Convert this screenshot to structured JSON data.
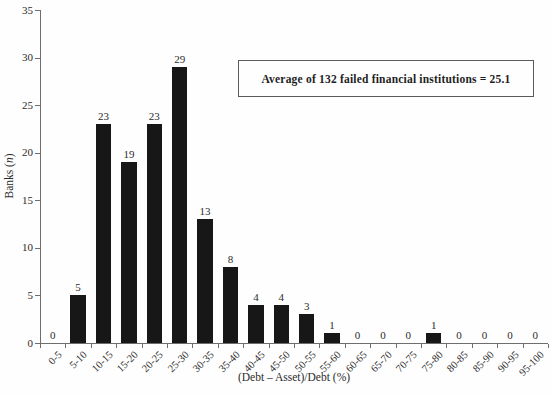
{
  "chart_data": {
    "type": "bar",
    "title": "",
    "categories": [
      "0-5",
      "5-10",
      "10-15",
      "15-20",
      "20-25",
      "25-30",
      "30-35",
      "35-40",
      "40-45",
      "45-50",
      "50-55",
      "55-60",
      "60-65",
      "65-70",
      "70-75",
      "75-80",
      "80-85",
      "85-90",
      "90-95",
      "95-100"
    ],
    "values": [
      0,
      5,
      23,
      19,
      23,
      29,
      13,
      8,
      4,
      4,
      3,
      1,
      0,
      0,
      0,
      1,
      0,
      0,
      0,
      0
    ],
    "xlabel": "(Debt – Asset)/Debt (%)",
    "ylabel_parts": {
      "prefix": "Banks (",
      "italic": "n",
      "suffix": ")"
    },
    "ylim": [
      0,
      35
    ],
    "ytick_step": 5,
    "grid": false,
    "legend": "none",
    "bar_color": "#171717",
    "axis_color": "#6e6e6e",
    "annotation": "Average of 132 failed financial institutions = 25.1"
  }
}
